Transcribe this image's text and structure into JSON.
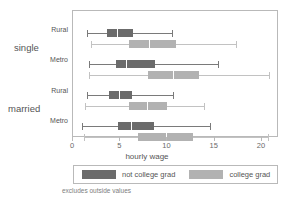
{
  "chart_data": {
    "type": "box",
    "title": "",
    "xlabel": "hourly wage",
    "ylabel": "",
    "xlim": [
      0,
      21.8
    ],
    "grid": false,
    "legend_position": "bottom",
    "footnote": "excludes outside values",
    "xticks": [
      0,
      5,
      10,
      15,
      20
    ],
    "xtick_labels": [
      "0",
      "5",
      "10",
      "15",
      "20"
    ],
    "outer_groups": [
      {
        "label": "single"
      },
      {
        "label": "married"
      }
    ],
    "inner_groups": [
      "Rural",
      "Metro",
      "Rural",
      "Metro"
    ],
    "series": [
      {
        "name": "not college grad",
        "color": "#6b6b6b"
      },
      {
        "name": "college grad",
        "color": "#b2b2b2"
      }
    ],
    "boxes": [
      {
        "outer": "single",
        "inner": "Rural",
        "series": "not college grad",
        "whisker_low": 1.5,
        "q1": 3.6,
        "median": 4.7,
        "q3": 6.4,
        "whisker_high": 10.5
      },
      {
        "outer": "single",
        "inner": "Rural",
        "series": "college grad",
        "whisker_low": 1.9,
        "q1": 5.9,
        "median": 8.0,
        "q3": 10.9,
        "whisker_high": 17.3
      },
      {
        "outer": "single",
        "inner": "Metro",
        "series": "not college grad",
        "whisker_low": 1.7,
        "q1": 4.5,
        "median": 5.6,
        "q3": 8.7,
        "whisker_high": 15.3
      },
      {
        "outer": "single",
        "inner": "Metro",
        "series": "college grad",
        "whisker_low": 1.7,
        "q1": 7.9,
        "median": 10.6,
        "q3": 13.3,
        "whisker_high": 20.7
      },
      {
        "outer": "married",
        "inner": "Rural",
        "series": "not college grad",
        "whisker_low": 1.5,
        "q1": 3.8,
        "median": 4.9,
        "q3": 6.2,
        "whisker_high": 10.6
      },
      {
        "outer": "married",
        "inner": "Rural",
        "series": "college grad",
        "whisker_low": 1.3,
        "q1": 5.9,
        "median": 7.8,
        "q3": 9.9,
        "whisker_high": 13.9
      },
      {
        "outer": "married",
        "inner": "Metro",
        "series": "not college grad",
        "whisker_low": 1.0,
        "q1": 4.8,
        "median": 6.1,
        "q3": 8.6,
        "whisker_high": 14.5
      },
      {
        "outer": "married",
        "inner": "Metro",
        "series": "college grad",
        "whisker_low": 1.2,
        "q1": 6.9,
        "median": 9.8,
        "q3": 12.7,
        "whisker_high": 20.6
      }
    ]
  },
  "axis": {
    "x_title": "hourly wage"
  },
  "legend": {
    "entries": [
      {
        "label": "not college grad",
        "color": "#6b6b6b"
      },
      {
        "label": "college grad",
        "color": "#b2b2b2"
      }
    ]
  },
  "labels": {
    "outer": [
      "single",
      "married"
    ],
    "inner": [
      "Rural",
      "Metro",
      "Rural",
      "Metro"
    ]
  },
  "footnote": "excludes outside values"
}
